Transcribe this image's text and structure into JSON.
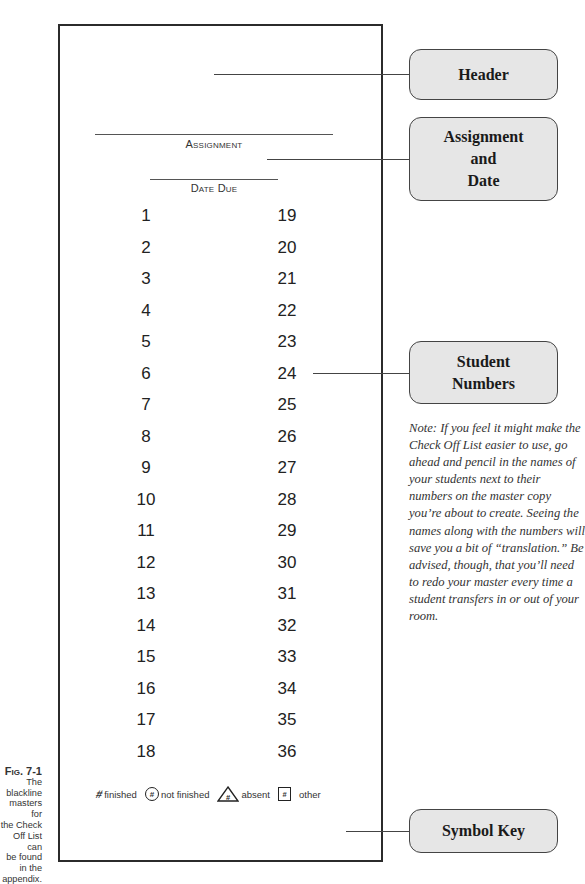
{
  "figure": {
    "caption_label": "Fig. 7-1",
    "caption_text": [
      "The",
      "blackline",
      "masters for",
      "the Check",
      "Off List can",
      "be found",
      "in the",
      "appendix."
    ]
  },
  "form": {
    "assignment_label": "Assignment",
    "date_due_label": "Date Due",
    "numbers_left": [
      "1",
      "2",
      "3",
      "4",
      "5",
      "6",
      "7",
      "8",
      "9",
      "10",
      "11",
      "12",
      "13",
      "14",
      "15",
      "16",
      "17",
      "18"
    ],
    "numbers_right": [
      "19",
      "20",
      "21",
      "22",
      "23",
      "24",
      "25",
      "26",
      "27",
      "28",
      "29",
      "30",
      "31",
      "32",
      "33",
      "34",
      "35",
      "36"
    ]
  },
  "symbol_key": {
    "items": [
      {
        "symbol": "#",
        "shape": "slash-icon",
        "label": "finished"
      },
      {
        "symbol": "#",
        "shape": "circle-icon",
        "label": "not finished"
      },
      {
        "symbol": "#",
        "shape": "triangle-icon",
        "label": "absent"
      },
      {
        "symbol": "#",
        "shape": "square-icon",
        "label": "other"
      }
    ]
  },
  "callouts": {
    "header": [
      "Header"
    ],
    "assignment_date": [
      "Assignment",
      "and",
      "Date"
    ],
    "student_numbers": [
      "Student",
      "Numbers"
    ],
    "symbol_key": [
      "Symbol Key"
    ]
  },
  "note": "Note: If you feel it might make the Check Off List easier to use, go ahead and pencil in the names of your students next to their numbers on the master copy you’re about to create. Seeing the names along with the numbers will save you a bit of “translation.” Be advised, though, that you’ll need to redo your master every time a student transfers in or out of your room.",
  "colors": {
    "callout_fill": "#e6e6e6",
    "frame_border": "#2b2b2b",
    "text": "#1a1a1a"
  }
}
